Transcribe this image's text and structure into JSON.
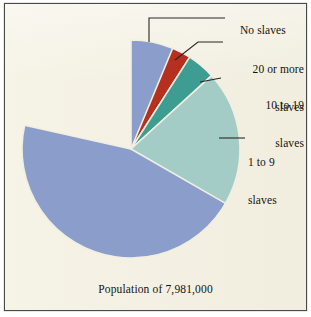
{
  "chart_data": {
    "type": "pie",
    "title": "",
    "subtitle": "",
    "caption": "Population of 7,981,000",
    "total_population": 7981000,
    "legend_position": "outside-right-callouts",
    "grid": false,
    "categories": [
      "No slaves",
      "20 or more slaves",
      "10 to 19 slaves",
      "1 to 9 slaves"
    ],
    "values": [
      78.5,
      2.8,
      4.2,
      14.5
    ],
    "value_unit": "percent",
    "colors": [
      "#8b9ecb",
      "#b5301f",
      "#3e9d92",
      "#a4ccc6"
    ],
    "slices": [
      {
        "label": "No slaves",
        "label_lines": [
          "No slaves"
        ],
        "value": 78.5,
        "color": "#8b9ecb",
        "start_angle_deg": -90,
        "end_angle_deg": 192.6
      },
      {
        "label": "20 or more slaves",
        "label_lines": [
          "20 or more",
          "slaves"
        ],
        "value": 2.8,
        "color": "#b5301f",
        "start_angle_deg": -67.5,
        "end_angle_deg": -57.4
      },
      {
        "label": "10 to 19 slaves",
        "label_lines": [
          "10 to 19",
          "slaves"
        ],
        "value": 4.2,
        "color": "#3e9d92",
        "start_angle_deg": -57.4,
        "end_angle_deg": -42.3
      },
      {
        "label": "1 to 9 slaves",
        "label_lines": [
          "1 to 9",
          "slaves"
        ],
        "value": 14.5,
        "color": "#a4ccc6",
        "start_angle_deg": -42.3,
        "end_angle_deg": 29.9
      }
    ],
    "xlabel": "",
    "ylabel": ""
  },
  "figure": {
    "background_color": "#f2efe0",
    "border_color": "#4a4a48",
    "text_color": "#15120e",
    "leader_line_color": "#2a2722",
    "slice_separator_color": "#f2efe0"
  },
  "labels": {
    "no_slaves": "No slaves",
    "twenty_or_more_line1": "20 or more",
    "twenty_or_more_line2": "slaves",
    "ten_to_nineteen_line1": "10 to 19",
    "ten_to_nineteen_line2": "slaves",
    "one_to_nine_line1": "1 to 9",
    "one_to_nine_line2": "slaves"
  },
  "caption": {
    "text": "Population of 7,981,000"
  }
}
